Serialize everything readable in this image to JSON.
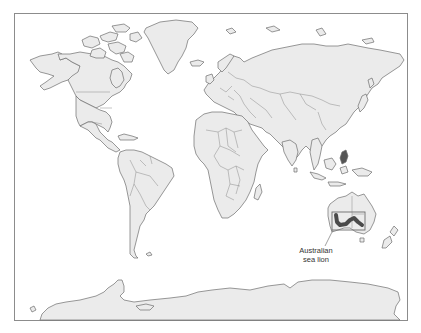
{
  "map": {
    "title": "World map",
    "projection": "Miller",
    "colors": {
      "land": "#ebebeb",
      "coastline": "#6d6d6d",
      "background": "#ffffff",
      "range_highlight": "#4a4a4a"
    }
  },
  "annotations": [
    {
      "id": "australian-sea-lion",
      "label_line1": "Australian",
      "label_line2": "sea lion",
      "region": "Southern and western coast of Australia"
    }
  ]
}
